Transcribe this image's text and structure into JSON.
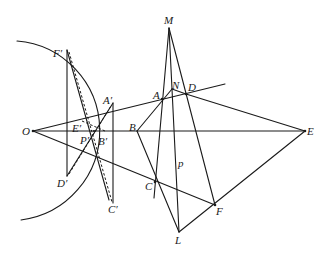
{
  "diagram": {
    "colors": {
      "stroke": "#1a1a1a",
      "background": "#ffffff"
    },
    "points": {
      "O": {
        "label": "O",
        "x": 33,
        "y": 131
      },
      "E": {
        "label": "E",
        "x": 305,
        "y": 131
      },
      "M": {
        "label": "M",
        "x": 169,
        "y": 28
      },
      "A": {
        "label": "A",
        "x": 162,
        "y": 99
      },
      "N": {
        "label": "N",
        "x": 172,
        "y": 89
      },
      "D": {
        "label": "D",
        "x": 186,
        "y": 94
      },
      "B": {
        "label": "B",
        "x": 137,
        "y": 131
      },
      "C": {
        "label": "C",
        "x": 155,
        "y": 182
      },
      "F": {
        "label": "F",
        "x": 215,
        "y": 205
      },
      "L": {
        "label": "L",
        "x": 179,
        "y": 232
      },
      "p": {
        "label": "p",
        "x": 180,
        "y": 165
      },
      "F1": {
        "label": "F′",
        "x": 67,
        "y": 50
      },
      "D1": {
        "label": "D′",
        "x": 67,
        "y": 176
      },
      "A1": {
        "label": "A′",
        "x": 113,
        "y": 103
      },
      "C1": {
        "label": "C′",
        "x": 113,
        "y": 203
      },
      "E1": {
        "label": "E′",
        "x": 82,
        "y": 121
      },
      "B1": {
        "label": "B′",
        "x": 105,
        "y": 131
      },
      "P1": {
        "label": "P′",
        "x": 91,
        "y": 135
      }
    },
    "circle": {
      "center": "O",
      "radius": 90
    }
  }
}
